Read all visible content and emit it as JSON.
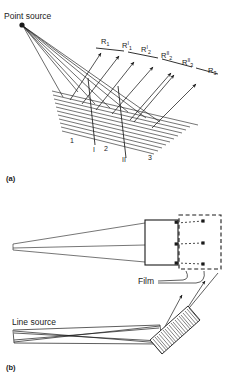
{
  "figure": {
    "title_a": "Point source",
    "title_b": "Line source",
    "film_label": "Film",
    "caption_a": "(a)",
    "caption_b": "(b)",
    "ink_color": "#1a1a1a",
    "background_color": "#ffffff"
  },
  "panel_a": {
    "source_label": "Point source",
    "caption": "(a)",
    "reflection_labels": [
      {
        "base": "R",
        "sub": "1",
        "sup": ""
      },
      {
        "base": "R",
        "sub": "1",
        "sup": "I"
      },
      {
        "base": "R",
        "sub": "2",
        "sup": "I"
      },
      {
        "base": "R",
        "sub": "2",
        "sup": "II"
      },
      {
        "base": "R",
        "sub": "3",
        "sup": "II"
      },
      {
        "base": "R",
        "sub": "3",
        "sup": ""
      }
    ],
    "region_labels": [
      "1",
      "I",
      "2",
      "II",
      "3"
    ],
    "crystal_plane_count": 11,
    "incident_ray_count": 6
  },
  "panel_b": {
    "source_label": "Line source",
    "film_label": "Film",
    "caption": "(b)",
    "solid_box_dot_count": 3,
    "dashed_box_dot_count": 3,
    "crystal_hatch_count": 22
  }
}
